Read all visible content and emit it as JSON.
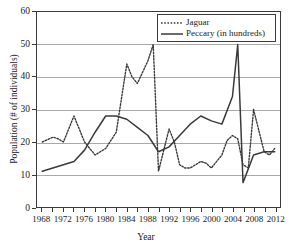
{
  "chart_data": {
    "type": "line",
    "title": "",
    "xlabel": "Year",
    "ylabel": "Population (# of individuals)",
    "xlim": [
      1967,
      2013
    ],
    "ylim": [
      0,
      60
    ],
    "ytick_step": 10,
    "yticks": [
      0,
      10,
      20,
      30,
      40,
      50,
      60
    ],
    "xticks_minor_step": 2,
    "xtick_labels": [
      "1968",
      "1972",
      "1976",
      "1980",
      "1984",
      "1988",
      "1992",
      "1996",
      "2000",
      "2004",
      "2008",
      "2012"
    ],
    "xticks_all": [
      1968,
      1970,
      1972,
      1974,
      1976,
      1978,
      1980,
      1982,
      1984,
      1986,
      1988,
      1990,
      1992,
      1994,
      1996,
      1998,
      2000,
      2002,
      2004,
      2006,
      2008,
      2010,
      2012
    ],
    "grid": "horizontal",
    "legend_position": "top-right",
    "x": [
      1968,
      1970,
      1972,
      1974,
      1976,
      1978,
      1980,
      1982,
      1984,
      1986,
      1988,
      1989,
      1990,
      1992,
      1994,
      1996,
      1998,
      2000,
      2002,
      2004,
      2006,
      2008,
      2010,
      2012
    ],
    "series": [
      {
        "name": "Jaguar",
        "style": "dotted",
        "color": "#3a3a3a",
        "values": [
          20,
          21.5,
          20,
          28,
          20,
          16,
          18,
          23,
          44,
          38,
          42,
          50,
          11,
          24,
          13,
          12,
          14,
          13.5,
          12,
          20.5,
          22,
          13,
          30,
          18
        ]
      },
      {
        "name": "Peccary (in hundreds)",
        "style": "solid",
        "color": "#3a3a3a",
        "values": [
          11,
          12,
          13,
          14,
          17.5,
          23,
          28,
          28,
          27,
          24.5,
          22,
          20,
          17,
          18.5,
          22,
          25.5,
          28,
          26.5,
          25.5,
          34,
          50,
          7.5,
          16,
          17
        ]
      }
    ],
    "series_detail": {
      "jaguar_points": [
        [
          1968,
          20
        ],
        [
          1970,
          21.5
        ],
        [
          1971,
          21
        ],
        [
          1972,
          20
        ],
        [
          1974,
          28
        ],
        [
          1976,
          20
        ],
        [
          1978,
          16
        ],
        [
          1980,
          18
        ],
        [
          1982,
          23
        ],
        [
          1984,
          44
        ],
        [
          1985,
          40
        ],
        [
          1986,
          38
        ],
        [
          1988,
          45
        ],
        [
          1989,
          50
        ],
        [
          1990,
          11
        ],
        [
          1992,
          24
        ],
        [
          1993,
          20
        ],
        [
          1994,
          13
        ],
        [
          1995,
          12
        ],
        [
          1996,
          12
        ],
        [
          1998,
          14
        ],
        [
          1999,
          13.5
        ],
        [
          2000,
          12
        ],
        [
          2002,
          16
        ],
        [
          2003,
          20.5
        ],
        [
          2004,
          22
        ],
        [
          2005,
          21
        ],
        [
          2006,
          13
        ],
        [
          2007,
          12
        ],
        [
          2008,
          30
        ],
        [
          2010,
          17
        ],
        [
          2011,
          16
        ],
        [
          2012,
          18
        ]
      ],
      "peccary_points": [
        [
          1968,
          11
        ],
        [
          1970,
          12
        ],
        [
          1972,
          13
        ],
        [
          1974,
          14
        ],
        [
          1976,
          17.5
        ],
        [
          1978,
          23
        ],
        [
          1980,
          28
        ],
        [
          1982,
          28
        ],
        [
          1984,
          27
        ],
        [
          1986,
          24.5
        ],
        [
          1988,
          22
        ],
        [
          1990,
          17
        ],
        [
          1992,
          18.5
        ],
        [
          1994,
          22
        ],
        [
          1996,
          25.5
        ],
        [
          1998,
          28
        ],
        [
          2000,
          26.5
        ],
        [
          2002,
          25.5
        ],
        [
          2004,
          34
        ],
        [
          2005,
          50
        ],
        [
          2006,
          7.5
        ],
        [
          2008,
          16
        ],
        [
          2010,
          17
        ],
        [
          2012,
          17
        ]
      ]
    }
  },
  "legend": {
    "entries": [
      {
        "label": "Jaguar",
        "style": "dotted"
      },
      {
        "label": "Peccary (in hundreds)",
        "style": "solid"
      }
    ]
  },
  "axes": {
    "y_title": "Population (# of individuals)",
    "x_title": "Year",
    "y_labels": [
      "60",
      "50",
      "40",
      "30",
      "20",
      "10",
      "0"
    ],
    "x_labels": [
      "1968",
      "1972",
      "1976",
      "1980",
      "1984",
      "1988",
      "1992",
      "1996",
      "2000",
      "2004",
      "2008",
      "2012"
    ]
  }
}
